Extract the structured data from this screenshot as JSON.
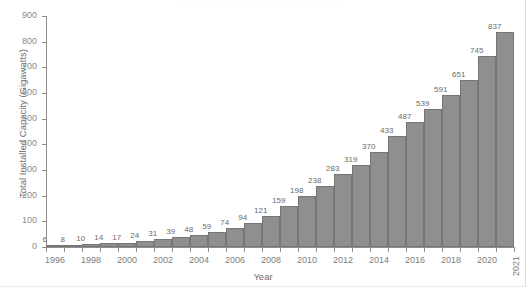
{
  "chart_data": {
    "type": "bar",
    "title": "Global Solar PV Total Installed Capacity",
    "xlabel": "Year",
    "ylabel": "Total Installed Capacity (Gigawatts)",
    "categories": [
      1996,
      1997,
      1998,
      1999,
      2000,
      2001,
      2002,
      2003,
      2004,
      2005,
      2006,
      2007,
      2008,
      2009,
      2010,
      2011,
      2012,
      2013,
      2014,
      2015,
      2016,
      2017,
      2018,
      2019,
      2020,
      2021
    ],
    "values": [
      6,
      8,
      10,
      14,
      17,
      24,
      31,
      39,
      48,
      59,
      74,
      94,
      121,
      159,
      198,
      238,
      283,
      319,
      370,
      433,
      487,
      539,
      591,
      651,
      745,
      837
    ],
    "ylim": [
      0,
      900
    ],
    "yticks": [
      0,
      100,
      200,
      300,
      400,
      500,
      600,
      700,
      800,
      900
    ],
    "xticks": [
      1996,
      1998,
      2000,
      2002,
      2004,
      2006,
      2008,
      2010,
      2012,
      2014,
      2016,
      2018,
      2020,
      2021
    ],
    "grid": false,
    "legend": false,
    "bar_color": "#8f8f8f",
    "bar_edge_color": "#757575",
    "axis_color": "#8f8f8f",
    "label_color": "#6b6b6b"
  }
}
